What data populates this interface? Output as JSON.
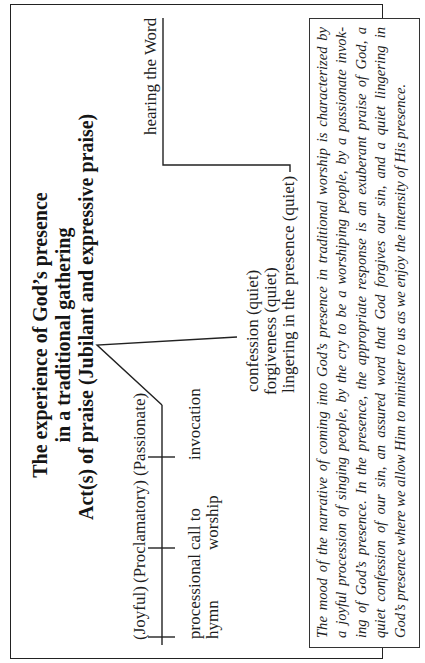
{
  "title": {
    "line1": "The experience of God’s presence",
    "line2": "in a traditional gathering",
    "line3": "Act(s) of praise (Jubilant and expressive praise)"
  },
  "timeline": {
    "moods": [
      {
        "label": "(Joyful)"
      },
      {
        "label": "(Proclamatory)"
      },
      {
        "label": "(Passionate)"
      }
    ],
    "steps": [
      {
        "line1": "processional",
        "line2": "hymn"
      },
      {
        "line1": "call to",
        "line2": "worship"
      },
      {
        "line1": "invocation",
        "line2": ""
      }
    ]
  },
  "quiet_responses": [
    {
      "label": "confession (quiet)"
    },
    {
      "label": "forgiveness (quiet)"
    },
    {
      "label": "lingering in the presence (quiet)"
    }
  ],
  "hearing": {
    "label": "hearing the Word"
  },
  "note": {
    "lines": [
      "The mood of the narrative of coming into God’s presence in traditional worship is characterized by",
      "a joyful procession of singing people, by the cry to be a worshiping people, by a passionate invok-",
      "ing of God’s presence. In the presence, the appropriate response is an exuberant praise of God, a",
      "quiet confession of our sin, an assured word that God forgives our sin, and a quiet lingering in",
      "God’s presence where we allow Him to minister to us as we enjoy the intensity of His presence."
    ]
  },
  "colors": {
    "ink": "#1e1e1e",
    "background": "#ffffff",
    "frame": "#222222"
  }
}
